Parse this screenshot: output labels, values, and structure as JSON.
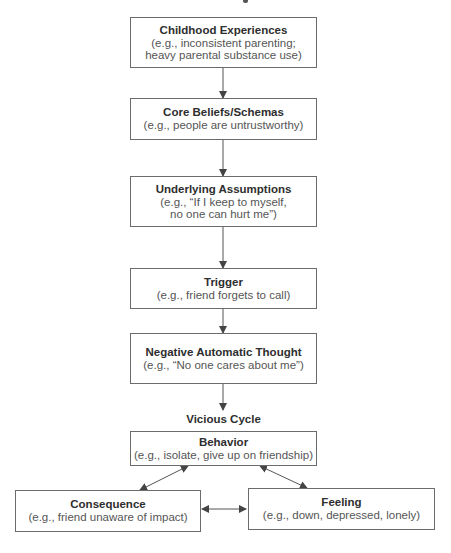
{
  "diagram": {
    "nodes": [
      {
        "id": "childhood",
        "title": "Childhood Experiences",
        "description": "(e.g., inconsistent parenting;\nheavy parental substance use)"
      },
      {
        "id": "core-beliefs",
        "title": "Core Beliefs/Schemas",
        "description": "(e.g., people are untrustworthy)"
      },
      {
        "id": "assumptions",
        "title": "Underlying Assumptions",
        "description": "(e.g., “If I keep to myself,\nno one can hurt me”)"
      },
      {
        "id": "trigger",
        "title": "Trigger",
        "description": "(e.g., friend forgets to call)"
      },
      {
        "id": "nat",
        "title": "Negative Automatic Thought",
        "description": "(e.g., “No one cares about me”)"
      },
      {
        "id": "behavior",
        "title": "Behavior",
        "description": "(e.g., isolate, give up on friendship)"
      },
      {
        "id": "consequence",
        "title": "Consequence",
        "description": "(e.g., friend unaware of impact)"
      },
      {
        "id": "feeling",
        "title": "Feeling",
        "description": "(e.g., down, depressed, lonely)"
      }
    ],
    "cycle_label": "Vicious Cycle",
    "edges": [
      {
        "from": "childhood",
        "to": "core-beliefs",
        "type": "one-way"
      },
      {
        "from": "core-beliefs",
        "to": "assumptions",
        "type": "one-way"
      },
      {
        "from": "assumptions",
        "to": "trigger",
        "type": "one-way"
      },
      {
        "from": "trigger",
        "to": "nat",
        "type": "one-way"
      },
      {
        "from": "nat",
        "to": "behavior",
        "type": "one-way"
      },
      {
        "from": "behavior",
        "to": "consequence",
        "type": "two-way"
      },
      {
        "from": "behavior",
        "to": "feeling",
        "type": "two-way"
      },
      {
        "from": "consequence",
        "to": "feeling",
        "type": "two-way"
      }
    ],
    "colors": {
      "border": "#6b6b6b",
      "arrow": "#444444",
      "title_text": "#2e2e2e",
      "desc_text": "#555555"
    }
  }
}
